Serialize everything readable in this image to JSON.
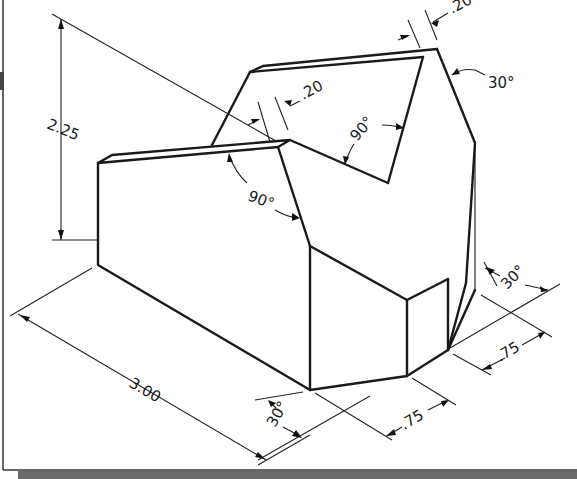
{
  "figure": {
    "type": "isometric-dimensioned-drawing"
  },
  "dimensions": {
    "height": "2.25",
    "length": "3.00",
    "chamfer_width_left": ".20",
    "chamfer_width_right": ".20",
    "v_notch_angle": "90°",
    "left_notch_angle": "90°",
    "top_right_angle": "30°",
    "bottom_left_angle": "30°",
    "bottom_right_angle": "30°",
    "front_width": ".75",
    "side_width": ".75"
  },
  "colors": {
    "line": "#1a1a1a",
    "background": "#ffffff",
    "bottom_bar": "#6a6a6a"
  }
}
